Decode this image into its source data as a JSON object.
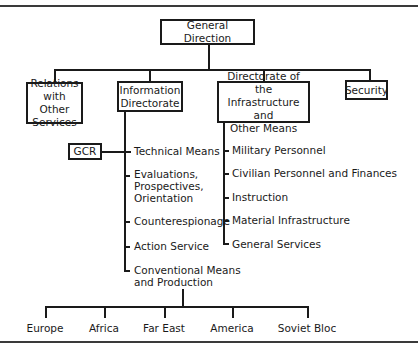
{
  "chart": {
    "root": "General Direction",
    "level1": [
      {
        "label": "Relations with Other Services",
        "lines": [
          "Relations",
          "with Other",
          "Services"
        ]
      },
      {
        "label": "Information Directorate",
        "lines": [
          "Information",
          "Directorate"
        ]
      },
      {
        "label": "Directorate of the Infrastructure and Other Means",
        "lines": [
          "Directorate of the",
          "Infrastructure and",
          "Other Means"
        ]
      },
      {
        "label": "Security",
        "lines": [
          "Security"
        ]
      }
    ],
    "information_directorate": {
      "side_box": "GCR",
      "items": [
        {
          "lines": [
            "Technical Means"
          ]
        },
        {
          "lines": [
            "Evaluations,",
            "Prospectives,",
            "Orientation"
          ]
        },
        {
          "lines": [
            "Counterespionage"
          ]
        },
        {
          "lines": [
            "Action Service"
          ]
        },
        {
          "lines": [
            "Conventional Means",
            "and Production"
          ]
        }
      ]
    },
    "infrastructure_directorate": {
      "items": [
        "Military Personnel",
        "Civilian Personnel and Finances",
        "Instruction",
        "Material Infrastructure",
        "General Services"
      ]
    },
    "regions": [
      "Europe",
      "Africa",
      "Far East",
      "America",
      "Soviet Bloc"
    ]
  }
}
